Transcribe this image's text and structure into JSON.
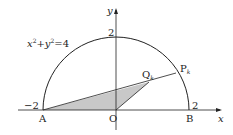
{
  "diagram": {
    "equation": "x² + y² = 4",
    "equation_parts": {
      "x": "x",
      "sup1": "2",
      "plus": "+",
      "y": "y",
      "sup2": "2",
      "eq": "=4"
    },
    "axes": {
      "x_label": "x",
      "y_label": "y"
    },
    "ticks": {
      "x_neg": "−2",
      "x_pos": "2",
      "y_top": "2"
    },
    "points": {
      "A": {
        "label": "A",
        "coord": [
          -2,
          0
        ]
      },
      "B": {
        "label": "B",
        "coord": [
          2,
          0
        ]
      },
      "O": {
        "label": "O",
        "coord": [
          0,
          0
        ]
      },
      "P": {
        "label": "P",
        "sub": "k"
      },
      "Q": {
        "label": "Q",
        "sub": "k"
      }
    },
    "colors": {
      "shade": "#c8c8c8",
      "stroke": "#222222"
    }
  }
}
